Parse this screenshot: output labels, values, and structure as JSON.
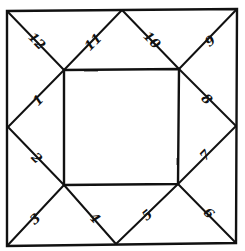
{
  "diagram": {
    "type": "astrological-chart-square",
    "houses": [
      {
        "number": "1",
        "label": "1"
      },
      {
        "number": "2",
        "label": "2"
      },
      {
        "number": "3",
        "label": "3"
      },
      {
        "number": "4",
        "label": "4"
      },
      {
        "number": "5",
        "label": "5"
      },
      {
        "number": "6",
        "label": "6"
      },
      {
        "number": "7",
        "label": "7"
      },
      {
        "number": "8",
        "label": "8"
      },
      {
        "number": "9",
        "label": "9"
      },
      {
        "number": "10",
        "label": "10"
      },
      {
        "number": "11",
        "label": "11"
      },
      {
        "number": "12",
        "label": "12"
      }
    ],
    "colors": {
      "ink": "#111111",
      "paper": "#ffffff"
    }
  }
}
